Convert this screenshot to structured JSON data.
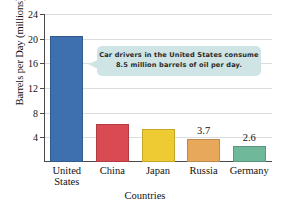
{
  "chart_data": {
    "type": "bar",
    "title": "",
    "xlabel": "Countries",
    "ylabel": "Barrels per Day (millions)",
    "categories": [
      "United States",
      "China",
      "Japan",
      "Russia",
      "Germany"
    ],
    "category_lines": [
      [
        "United",
        "States"
      ],
      [
        "China"
      ],
      [
        "Japan"
      ],
      [
        "Russia"
      ],
      [
        "Germany"
      ]
    ],
    "values": [
      20.5,
      6.2,
      5.4,
      3.7,
      2.6
    ],
    "value_labels": [
      "",
      "",
      "",
      "3.7",
      "2.6"
    ],
    "bar_colors": [
      "#3e6fae",
      "#d94a52",
      "#efcb33",
      "#e8a85c",
      "#6fb89a"
    ],
    "ylim": [
      0,
      24
    ],
    "yticks": [
      4,
      8,
      12,
      16,
      20,
      24
    ],
    "ytick_labels": [
      "4",
      "8",
      "12",
      "16",
      "20",
      "24"
    ],
    "grid": true,
    "legend": "none"
  },
  "annotation": {
    "name": "callout",
    "line1": "Car drivers in the United States consume",
    "line2": "8.5 million barrels of oil per day.",
    "background_color": "#cfe4e4",
    "points_to": "United States"
  }
}
